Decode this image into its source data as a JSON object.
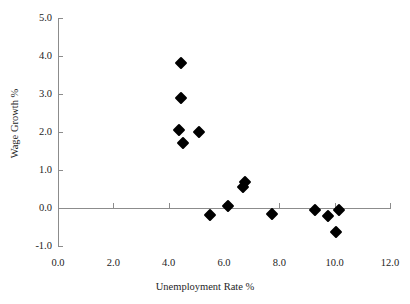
{
  "chart_data": {
    "type": "scatter",
    "title": "",
    "xlabel": "Unemployment Rate %",
    "ylabel": "Wage Growth %",
    "xlim": [
      0.0,
      12.0
    ],
    "ylim": [
      -1.0,
      5.0
    ],
    "xticks": [
      "0.0",
      "2.0",
      "4.0",
      "6.0",
      "8.0",
      "10.0",
      "12.0"
    ],
    "xtick_values": [
      0.0,
      2.0,
      4.0,
      6.0,
      8.0,
      10.0,
      12.0
    ],
    "yticks": [
      "-1.0",
      "0.0",
      "1.0",
      "2.0",
      "3.0",
      "4.0",
      "5.0"
    ],
    "ytick_values": [
      -1.0,
      0.0,
      1.0,
      2.0,
      3.0,
      4.0,
      5.0
    ],
    "grid": false,
    "legend": false,
    "marker": "diamond",
    "marker_color": "#000000",
    "axis_color": "#8c8c8c",
    "points": [
      {
        "x": 4.45,
        "y": 3.82
      },
      {
        "x": 4.45,
        "y": 2.9
      },
      {
        "x": 4.37,
        "y": 2.05
      },
      {
        "x": 5.1,
        "y": 2.0
      },
      {
        "x": 4.5,
        "y": 1.7
      },
      {
        "x": 6.75,
        "y": 0.68
      },
      {
        "x": 6.7,
        "y": 0.55
      },
      {
        "x": 6.15,
        "y": 0.04
      },
      {
        "x": 5.5,
        "y": -0.18
      },
      {
        "x": 7.75,
        "y": -0.15
      },
      {
        "x": 9.3,
        "y": -0.06
      },
      {
        "x": 9.75,
        "y": -0.22
      },
      {
        "x": 10.15,
        "y": -0.05
      },
      {
        "x": 10.05,
        "y": -0.63
      }
    ]
  }
}
